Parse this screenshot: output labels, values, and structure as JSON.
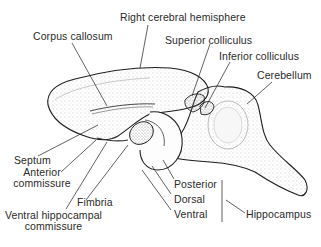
{
  "diagram": {
    "labels": {
      "right_cerebral_hemisphere": "Right cerebral hemisphere",
      "corpus_callosum": "Corpus callosum",
      "superior_colliculus": "Superior colliculus",
      "inferior_colliculus": "Inferior colliculus",
      "cerebellum": "Cerebellum",
      "septum": "Septum",
      "anterior_commissure_line1": "Anterior",
      "anterior_commissure_line2": "commissure",
      "fimbria": "Fimbria",
      "ventral_hippocampal_commissure_line1": "Ventral hippocampal",
      "ventral_hippocampal_commissure_line2": "commissure",
      "posterior": "Posterior",
      "dorsal": "Dorsal",
      "ventral": "Ventral",
      "hippocampus": "Hippocampus"
    },
    "colors": {
      "ink": "#1e1e1e",
      "stipple": "#9a9a9a",
      "background": "#ffffff"
    }
  }
}
